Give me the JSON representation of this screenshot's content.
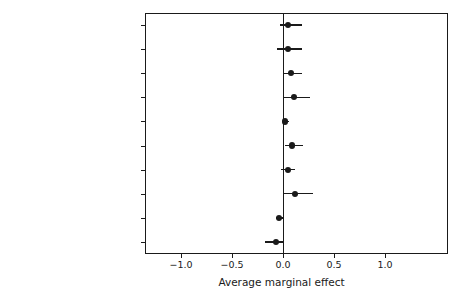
{
  "chart_data": {
    "type": "scatter",
    "title": "",
    "xlabel": "Average marginal effect",
    "ylabel": "",
    "xlim": [
      -1.3,
      1.4
    ],
    "grid": false,
    "legend": null,
    "orientation": "horizontal",
    "style": "coefficient-plot-with-confidence-intervals",
    "reference_line": 0.0,
    "xticks": [
      -1.0,
      -0.5,
      0.0,
      0.5,
      1.0
    ],
    "xtick_labels": [
      "−1.0",
      "−0.5",
      "0.0",
      "0.5",
      "1.0"
    ],
    "categories": [
      "LER below parity (1800–1917)",
      "LER below parity (1918–2011)",
      "Mass desertion (1800–1917)",
      "Mass desertion (1918–2011)",
      "Mass defection (1800–1917)",
      "Mass defection (1918–2011)",
      "Blocking units (1800–1917)",
      "Blocking units (1918–2011)",
      "BPI (1800–1917)",
      "BPI (1918–2011)"
    ],
    "values": [
      0.05,
      0.05,
      0.08,
      0.11,
      0.02,
      0.09,
      0.05,
      0.12,
      -0.04,
      -0.07
    ],
    "ci_low": [
      -0.03,
      -0.06,
      0.01,
      0.01,
      0.0,
      0.02,
      -0.02,
      0.0,
      -0.07,
      -0.18
    ],
    "ci_high": [
      0.19,
      0.19,
      0.19,
      0.26,
      0.06,
      0.2,
      0.12,
      0.29,
      0.0,
      0.01
    ],
    "points": [
      {
        "label": "LER below parity (1800–1917)",
        "estimate": 0.05,
        "ci_low": -0.03,
        "ci_high": 0.19
      },
      {
        "label": "LER below parity (1918–2011)",
        "estimate": 0.05,
        "ci_low": -0.06,
        "ci_high": 0.19
      },
      {
        "label": "Mass desertion (1800–1917)",
        "estimate": 0.08,
        "ci_low": 0.01,
        "ci_high": 0.19
      },
      {
        "label": "Mass desertion (1918–2011)",
        "estimate": 0.11,
        "ci_low": 0.01,
        "ci_high": 0.26
      },
      {
        "label": "Mass defection (1800–1917)",
        "estimate": 0.02,
        "ci_low": 0.0,
        "ci_high": 0.06
      },
      {
        "label": "Mass defection (1918–2011)",
        "estimate": 0.09,
        "ci_low": 0.02,
        "ci_high": 0.2
      },
      {
        "label": "Blocking units (1800–1917)",
        "estimate": 0.05,
        "ci_low": -0.02,
        "ci_high": 0.12
      },
      {
        "label": "Blocking units (1918–2011)",
        "estimate": 0.12,
        "ci_low": 0.0,
        "ci_high": 0.29
      },
      {
        "label": "BPI (1800–1917)",
        "estimate": -0.04,
        "ci_low": -0.07,
        "ci_high": 0.0
      },
      {
        "label": "BPI (1918–2011)",
        "estimate": -0.07,
        "ci_low": -0.18,
        "ci_high": 0.01
      }
    ]
  },
  "colors": {
    "axis": "#1a1a1a",
    "marker": "#1a1a1a",
    "background": "#ffffff"
  }
}
